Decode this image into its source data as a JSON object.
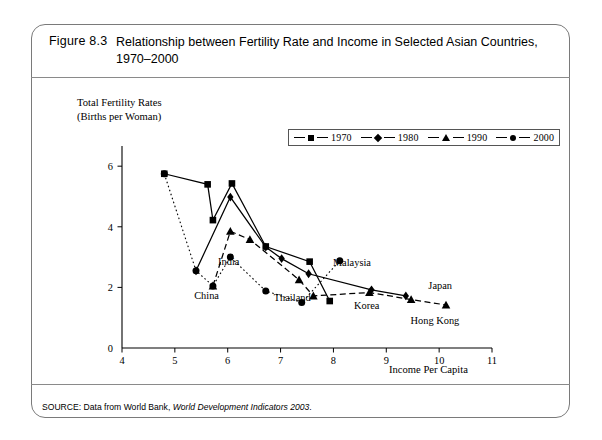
{
  "figure": {
    "label": "Figure 8.3",
    "title": "Relationship between Fertility Rate and Income in Selected Asian Countries, 1970–2000",
    "source_prefix": "SOURCE: Data from World Bank, ",
    "source_italic": "World Development Indicators 2003",
    "source_suffix": "."
  },
  "chart_data": {
    "type": "scatter",
    "title": "Relationship between Fertility Rate and Income in Selected Asian Countries, 1970–2000",
    "xlabel": "Income Per Capita",
    "ylabel": "Total Fertility Rates (Births per Woman)",
    "ylabel_line1": "Total Fertility Rates",
    "ylabel_line2": "(Births per Woman)",
    "xlim": [
      4,
      11
    ],
    "ylim": [
      0,
      6.6
    ],
    "xticks": [
      4,
      5,
      6,
      7,
      8,
      9,
      10,
      11
    ],
    "yticks": [
      0,
      2,
      4,
      6
    ],
    "grid": false,
    "legend_position": "top-center",
    "series": [
      {
        "name": "1970",
        "marker": "square",
        "line": "solid",
        "color": "#000000",
        "points": [
          {
            "country": "China",
            "x": 4.8,
            "y": 5.75
          },
          {
            "country": "India",
            "x": 5.62,
            "y": 5.4
          },
          {
            "country": "Malaysia",
            "x": 6.08,
            "y": 5.43
          },
          {
            "country": "Thailand",
            "x": 5.72,
            "y": 4.22
          },
          {
            "country": "Korea",
            "x": 6.72,
            "y": 3.35
          },
          {
            "country": "Hong Kong",
            "x": 7.55,
            "y": 2.85
          },
          {
            "country": "Japan",
            "x": 7.93,
            "y": 1.55
          }
        ]
      },
      {
        "name": "1980",
        "marker": "diamond",
        "line": "solid",
        "color": "#000000",
        "points": [
          {
            "country": "China",
            "x": 5.4,
            "y": 2.55
          },
          {
            "country": "India",
            "x": 6.05,
            "y": 4.98
          },
          {
            "country": "Malaysia",
            "x": 6.72,
            "y": 3.33
          },
          {
            "country": "Thailand",
            "x": 7.02,
            "y": 2.95
          },
          {
            "country": "Korea",
            "x": 7.53,
            "y": 2.45
          },
          {
            "country": "Japan",
            "x": 8.72,
            "y": 1.92
          },
          {
            "country": "Hong Kong",
            "x": 9.37,
            "y": 1.72
          }
        ]
      },
      {
        "name": "1990",
        "marker": "triangle",
        "line": "dashed",
        "color": "#000000",
        "points": [
          {
            "country": "China",
            "x": 5.72,
            "y": 2.05
          },
          {
            "country": "India",
            "x": 6.05,
            "y": 3.85
          },
          {
            "country": "Malaysia",
            "x": 6.42,
            "y": 3.58
          },
          {
            "country": "Thailand",
            "x": 7.35,
            "y": 2.25
          },
          {
            "country": "Korea",
            "x": 7.62,
            "y": 1.72
          },
          {
            "country": "Japan",
            "x": 8.68,
            "y": 1.83
          },
          {
            "country": "Hong Kong",
            "x": 9.47,
            "y": 1.6
          },
          {
            "country": "Extra",
            "x": 10.13,
            "y": 1.42
          }
        ]
      },
      {
        "name": "2000",
        "marker": "circle",
        "line": "dotted",
        "color": "#000000",
        "points": [
          {
            "country": "China",
            "x": 4.8,
            "y": 5.75
          },
          {
            "country": "India",
            "x": 5.4,
            "y": 2.55
          },
          {
            "country": "Thailand",
            "x": 5.72,
            "y": 2.05
          },
          {
            "country": "Korea",
            "x": 6.72,
            "y": 1.88
          },
          {
            "country": "Malaysia",
            "x": 8.12,
            "y": 2.88
          },
          {
            "country": "Japan",
            "x": 6.05,
            "y": 3.0
          },
          {
            "country": "Hong Kong",
            "x": 7.4,
            "y": 1.5
          }
        ]
      }
    ],
    "annotations": [
      {
        "text": "India",
        "x": 6.02,
        "y": 2.73
      },
      {
        "text": "China",
        "x": 5.6,
        "y": 1.62
      },
      {
        "text": "Thailand",
        "x": 7.22,
        "y": 1.56
      },
      {
        "text": "Malaysia",
        "x": 8.35,
        "y": 2.72
      },
      {
        "text": "Korea",
        "x": 8.63,
        "y": 1.28
      },
      {
        "text": "Japan",
        "x": 10.02,
        "y": 1.95
      },
      {
        "text": "Hong Kong",
        "x": 9.92,
        "y": 0.78
      }
    ],
    "legend": [
      {
        "label": "1970",
        "marker": "square"
      },
      {
        "label": "1980",
        "marker": "diamond"
      },
      {
        "label": "1990",
        "marker": "triangle"
      },
      {
        "label": "2000",
        "marker": "circle"
      }
    ]
  }
}
